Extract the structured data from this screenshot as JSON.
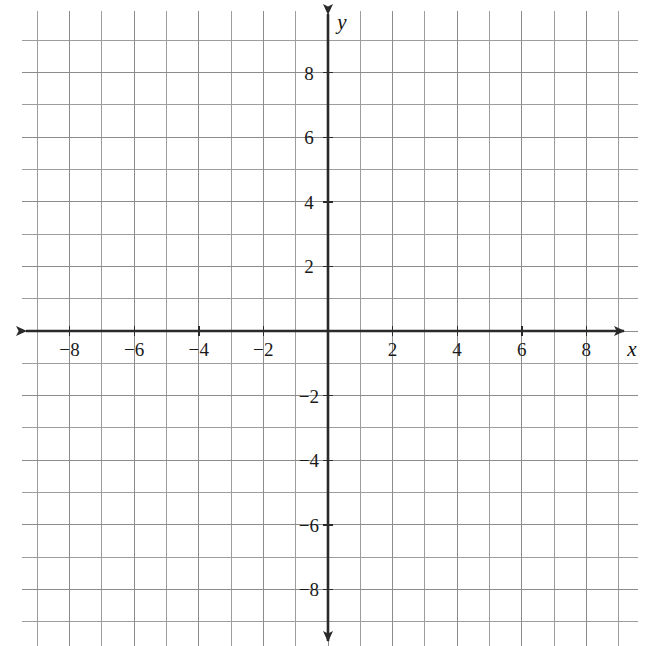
{
  "chart_data": {
    "type": "scatter",
    "title": "",
    "subtitle": "",
    "xlabel": "x",
    "ylabel": "y",
    "xlim": [
      -9.5,
      9.6
    ],
    "ylim": [
      -9.75,
      9.9
    ],
    "grid": true,
    "legend": null,
    "series": [],
    "x": [],
    "values": [],
    "annotations": [],
    "x_tick_labels": [
      "-8",
      "-6",
      "-4",
      "-2",
      "2",
      "4",
      "6",
      "8"
    ],
    "x_tick_values": [
      -8,
      -6,
      -4,
      -2,
      2,
      4,
      6,
      8
    ],
    "y_tick_labels": [
      "8",
      "6",
      "4",
      "2",
      "-2",
      "-4",
      "-6",
      "-8"
    ],
    "y_tick_values": [
      8,
      6,
      4,
      2,
      -2,
      -4,
      -6,
      -8
    ],
    "major_tick_step": 2,
    "minor_grid_step": 1,
    "axis_color": "#2a2a2a",
    "grid_color": "#9a9a9a",
    "background_color": "#ffffff"
  },
  "plot": {
    "origin_x": 328,
    "origin_y": 331,
    "unit_px": 32.3,
    "grid_left": 22,
    "grid_top": 11,
    "grid_right": 638,
    "grid_bottom": 646,
    "x_axis_arrow_left": 26,
    "x_axis_arrow_right": 624,
    "y_axis_arrow_top": 14,
    "y_axis_arrow_bottom": 641,
    "axis_label_x": "x",
    "axis_label_y": "y"
  },
  "x_ticks": [
    {
      "label": "−8",
      "value": -8
    },
    {
      "label": "−6",
      "value": -6
    },
    {
      "label": "−4",
      "value": -4
    },
    {
      "label": "−2",
      "value": -2
    },
    {
      "label": "2",
      "value": 2
    },
    {
      "label": "4",
      "value": 4
    },
    {
      "label": "6",
      "value": 6
    },
    {
      "label": "8",
      "value": 8
    }
  ],
  "y_ticks": [
    {
      "label": "8",
      "value": 8
    },
    {
      "label": "6",
      "value": 6
    },
    {
      "label": "4",
      "value": 4
    },
    {
      "label": "2",
      "value": 2
    },
    {
      "label": "−2",
      "value": -2
    },
    {
      "label": "−4",
      "value": -4
    },
    {
      "label": "−6",
      "value": -6
    },
    {
      "label": "−8",
      "value": -8
    }
  ]
}
